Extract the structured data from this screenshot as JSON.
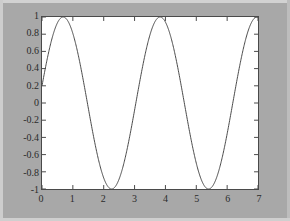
{
  "figure": {
    "background_color": "#a8a8a8",
    "axes_background_color": "#ffffff",
    "axes_line_color": "#4a4a4a",
    "curve_color": "#4a4a4a"
  },
  "chart_data": {
    "type": "line",
    "title": "",
    "xlabel": "",
    "ylabel": "",
    "xlim": [
      0,
      7
    ],
    "ylim": [
      -1,
      1
    ],
    "grid": false,
    "legend": null,
    "xticks": [
      0,
      1,
      2,
      3,
      4,
      5,
      6,
      7
    ],
    "xtick_labels": [
      "0",
      "1",
      "2",
      "3",
      "4",
      "5",
      "6",
      "7"
    ],
    "yticks": [
      -1,
      -0.8,
      -0.6,
      -0.4,
      -0.2,
      0,
      0.2,
      0.4,
      0.6,
      0.8,
      1
    ],
    "ytick_labels": [
      "1",
      "0.8",
      "0.6",
      "0.4",
      "0.2",
      "0",
      "-0.2",
      "-0.4",
      "-0.6",
      "-0.8",
      "-1"
    ],
    "series": [
      {
        "name": "sin(2x + 0.2)",
        "formula": "y = sin(2*x + 0.2)",
        "line_style": "solid",
        "line_width": 1,
        "color": "#4a4a4a",
        "x": [
          0,
          0.1,
          0.2,
          0.3,
          0.4,
          0.5,
          0.6,
          0.7,
          0.8,
          0.9,
          1,
          1.1,
          1.2,
          1.3,
          1.4,
          1.5,
          1.6,
          1.7,
          1.8,
          1.9,
          2,
          2.1,
          2.2,
          2.3,
          2.4,
          2.5,
          2.6,
          2.7,
          2.8,
          2.9,
          3,
          3.1,
          3.2,
          3.3,
          3.4,
          3.5,
          3.6,
          3.7,
          3.8,
          3.9,
          4,
          4.1,
          4.2,
          4.3,
          4.4,
          4.5,
          4.6,
          4.7,
          4.8,
          4.9,
          5,
          5.1,
          5.2,
          5.3,
          5.4,
          5.5,
          5.6,
          5.7,
          5.8,
          5.9,
          6,
          6.1,
          6.2,
          6.3,
          6.4,
          6.5,
          6.6,
          6.7,
          6.8,
          6.9,
          7
        ],
        "y": [
          0.199,
          0.389,
          0.565,
          0.717,
          0.842,
          0.932,
          0.985,
          1.0,
          0.974,
          0.909,
          0.808,
          0.675,
          0.516,
          0.335,
          0.141,
          -0.058,
          -0.255,
          -0.442,
          -0.611,
          -0.755,
          -0.869,
          -0.948,
          -0.991,
          -0.994,
          -0.958,
          -0.884,
          -0.774,
          -0.633,
          -0.467,
          -0.283,
          -0.088,
          0.111,
          0.305,
          0.487,
          0.649,
          0.784,
          0.886,
          0.952,
          0.998,
          0.999,
          0.961,
          0.887,
          0.779,
          0.641,
          0.479,
          0.299,
          0.108,
          -0.087,
          -0.278,
          -0.457,
          -0.618,
          -0.754,
          -0.861,
          -0.935,
          -0.974,
          -0.977,
          -0.944,
          -0.875,
          -0.774,
          -0.643,
          -0.487,
          -0.312,
          -0.125,
          0.068,
          0.26,
          0.443,
          0.61,
          0.754,
          0.869,
          0.949,
          0.991
        ],
        "peaks": [
          {
            "x": 0.69,
            "y": 1
          },
          {
            "x": 3.83,
            "y": 1
          }
        ],
        "troughs": [
          {
            "x": 2.26,
            "y": -1
          },
          {
            "x": 5.4,
            "y": -1
          }
        ],
        "period": 3.1416,
        "amplitude": 1,
        "start_value": 0.199,
        "end_value": 0.991
      }
    ]
  }
}
